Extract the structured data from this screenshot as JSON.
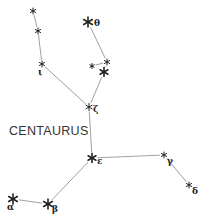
{
  "diagram": {
    "title": "CENTAURUS",
    "stars": [
      {
        "id": "s1",
        "x": 33,
        "y": 11,
        "size": 3,
        "label": ""
      },
      {
        "id": "s2",
        "x": 38,
        "y": 31,
        "size": 3,
        "label": ""
      },
      {
        "id": "iota",
        "x": 42,
        "y": 64,
        "size": 3,
        "label": "ι"
      },
      {
        "id": "theta",
        "x": 88,
        "y": 22,
        "size": 5,
        "label": "θ"
      },
      {
        "id": "s5",
        "x": 92,
        "y": 66,
        "size": 2.5,
        "label": ""
      },
      {
        "id": "s6",
        "x": 107,
        "y": 62,
        "size": 3,
        "label": ""
      },
      {
        "id": "s7",
        "x": 104,
        "y": 72,
        "size": 4.5,
        "label": ""
      },
      {
        "id": "zeta",
        "x": 89,
        "y": 107,
        "size": 3.5,
        "label": "ζ"
      },
      {
        "id": "epsilon",
        "x": 92,
        "y": 158,
        "size": 4.5,
        "label": "ε"
      },
      {
        "id": "gamma",
        "x": 164,
        "y": 155,
        "size": 3,
        "label": "γ"
      },
      {
        "id": "delta",
        "x": 189,
        "y": 185,
        "size": 3,
        "label": "δ"
      },
      {
        "id": "alpha",
        "x": 13,
        "y": 199,
        "size": 5,
        "label": "α"
      },
      {
        "id": "beta",
        "x": 48,
        "y": 204,
        "size": 5,
        "label": "β"
      }
    ],
    "edges": [
      [
        "s1",
        "s2"
      ],
      [
        "s2",
        "iota"
      ],
      [
        "iota",
        "zeta"
      ],
      [
        "theta",
        "s6"
      ],
      [
        "s5",
        "s6"
      ],
      [
        "s6",
        "s7"
      ],
      [
        "s7",
        "zeta"
      ],
      [
        "zeta",
        "epsilon"
      ],
      [
        "epsilon",
        "gamma"
      ],
      [
        "gamma",
        "delta"
      ],
      [
        "epsilon",
        "beta"
      ],
      [
        "beta",
        "alpha"
      ]
    ]
  }
}
